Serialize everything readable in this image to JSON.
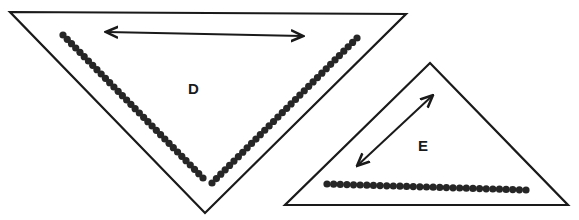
{
  "figure": {
    "width": 579,
    "height": 220,
    "colors": {
      "ink": "#1a1a1a",
      "bead": "#262626",
      "background": "#ffffff"
    }
  },
  "triangles": [
    {
      "id": "D",
      "label": "D",
      "label_pos": [
        188,
        94
      ],
      "vertices": [
        [
          10,
          12
        ],
        [
          406,
          14
        ],
        [
          205,
          213
        ]
      ],
      "bead_chain": {
        "segments": [
          {
            "from": [
              63,
              35
            ],
            "to": [
              203,
              178
            ],
            "count": 34
          },
          {
            "from": [
              212,
              183
            ],
            "to": [
              357,
              38
            ],
            "count": 34
          }
        ]
      },
      "arrow": {
        "from": [
          107,
          32
        ],
        "to": [
          302,
          36
        ],
        "double_headed": true
      }
    },
    {
      "id": "E",
      "label": "E",
      "label_pos": [
        418,
        151
      ],
      "vertices": [
        [
          430,
          63
        ],
        [
          568,
          205
        ],
        [
          285,
          205
        ]
      ],
      "bead_chain": {
        "segments": [
          {
            "from": [
              327,
              184
            ],
            "to": [
              526,
              190
            ],
            "count": 31
          }
        ]
      },
      "arrow": {
        "from": [
          432,
          96
        ],
        "to": [
          358,
          165
        ],
        "double_headed": true
      }
    }
  ]
}
